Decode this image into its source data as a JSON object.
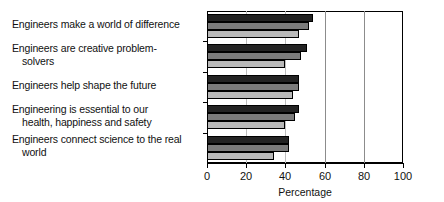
{
  "chart_data": {
    "type": "bar",
    "orientation": "horizontal",
    "title": "",
    "xlabel": "Percentage",
    "ylabel": "",
    "xlim": [
      0,
      100
    ],
    "xticks": [
      0,
      20,
      40,
      60,
      80,
      100
    ],
    "xticklabels": [
      "0",
      "20",
      "40",
      "60",
      "80",
      "100"
    ],
    "grid": true,
    "gridlines_x": [
      20,
      40,
      60,
      80
    ],
    "legend": null,
    "categories": [
      "Engineers make a world of difference",
      "Engineers are creative problem-solvers",
      "Engineers help shape the future",
      "Engineering is essential to our health, happiness and safety",
      "Engineers connect science to the real world"
    ],
    "category_lines": [
      [
        "Engineers make a world of difference"
      ],
      [
        "Engineers are creative problem-",
        "solvers"
      ],
      [
        "Engineers help shape the future"
      ],
      [
        "Engineering is essential to our",
        "health, happiness and safety"
      ],
      [
        "Engineers connect science to the real",
        "world"
      ]
    ],
    "series": [
      {
        "name": "series-1",
        "color": "#232323",
        "values": [
          54,
          51,
          47,
          47,
          42
        ]
      },
      {
        "name": "series-2",
        "color": "#7b7b7b",
        "values": [
          52,
          48,
          47,
          45,
          42
        ]
      },
      {
        "name": "series-3",
        "color": "#b9b9b9",
        "values": [
          47,
          40,
          44,
          40,
          34
        ]
      }
    ]
  }
}
